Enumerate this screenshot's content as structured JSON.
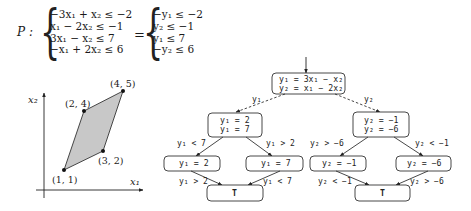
{
  "system": {
    "name": "P :",
    "equals": "=",
    "left_constraints": [
      "−3x₁ + x₂ ≤ −2",
      "x₁ − 2x₂ ≤ −1",
      "3x₁ − x₂ ≤ 7",
      "−x₁ + 2x₂ ≤ 6"
    ],
    "right_constraints": [
      "−y₁ ≤ −2",
      "y₂ ≤ −1",
      "y₁ ≤ 7",
      "−y₂ ≤ 6"
    ]
  },
  "plot": {
    "x_axis_label": "x₁",
    "y_axis_label": "x₂",
    "fill_color": "#c8c8c8",
    "vertices": [
      {
        "label": "(1, 1)"
      },
      {
        "label": "(3, 2)"
      },
      {
        "label": "(4, 5)"
      },
      {
        "label": "(2, 4)"
      }
    ]
  },
  "tree": {
    "root": {
      "line1": "y₁ = 3x₁ − x₂",
      "line2": "y₂ = x₁ − 2x₂"
    },
    "branch_labels": {
      "left": "y₁",
      "right": "y₂"
    },
    "left_mid": {
      "line1": "y₁ = 2",
      "line2": "y₁ = 7"
    },
    "right_mid": {
      "line1": "y₂ = −1",
      "line2": "y₂ = −6"
    },
    "leaves": [
      {
        "text": "y₁ = 2"
      },
      {
        "text": "y₁ = 7"
      },
      {
        "text": "y₂ = −1"
      },
      {
        "text": "y₂ = −6"
      }
    ],
    "terminals": [
      {
        "text": "T"
      },
      {
        "text": "T"
      }
    ],
    "edge_labels": {
      "lm_to_a": "y₁ < 7",
      "lm_to_b": "y₁ > 2",
      "a_to_t1": "y₁ > 2",
      "b_to_t1": "y₁ < 7",
      "rm_to_c": "y₂ > −6",
      "rm_to_d": "y₂ < −1",
      "c_to_t2": "y₂ < −1",
      "d_to_t2": "y₂ > −6"
    }
  }
}
